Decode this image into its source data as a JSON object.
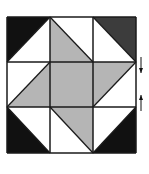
{
  "diagram": {
    "type": "quilt-block",
    "grid": {
      "rows": 3,
      "cols": 3,
      "x": [
        7,
        50,
        93,
        136
      ],
      "y": [
        17,
        62,
        107,
        153
      ]
    },
    "colors": {
      "black": "#111111",
      "dark": "#3c3c3c",
      "gray": "#b5b5b5",
      "white": "#ffffff",
      "line": "#1a1a1a"
    },
    "cells": [
      {
        "id": "top-left",
        "row": 0,
        "col": 0,
        "diag": "bl-tr",
        "a": "black",
        "b": "white"
      },
      {
        "id": "top-middle",
        "row": 0,
        "col": 1,
        "diag": "tl-br",
        "a": "white",
        "b": "gray"
      },
      {
        "id": "top-right",
        "row": 0,
        "col": 2,
        "diag": "tl-br",
        "a": "dark",
        "b": "white"
      },
      {
        "id": "middle-left",
        "row": 1,
        "col": 0,
        "diag": "bl-tr",
        "a": "white",
        "b": "gray"
      },
      {
        "id": "center",
        "row": 1,
        "col": 1,
        "diag": "none",
        "a": "gray",
        "b": "gray"
      },
      {
        "id": "middle-right",
        "row": 1,
        "col": 2,
        "diag": "bl-tr",
        "a": "gray",
        "b": "white"
      },
      {
        "id": "bottom-left",
        "row": 2,
        "col": 0,
        "diag": "tl-br",
        "a": "white",
        "b": "black"
      },
      {
        "id": "bottom-middle",
        "row": 2,
        "col": 1,
        "diag": "tl-br",
        "a": "gray",
        "b": "white"
      },
      {
        "id": "bottom-right",
        "row": 2,
        "col": 2,
        "diag": "bl-tr",
        "a": "white",
        "b": "black"
      }
    ],
    "arrows": [
      {
        "id": "arrow-down",
        "direction": "down",
        "x": 141,
        "y1": 57,
        "y2": 73
      },
      {
        "id": "arrow-up",
        "direction": "up",
        "x": 141,
        "y1": 111,
        "y2": 95
      }
    ]
  }
}
